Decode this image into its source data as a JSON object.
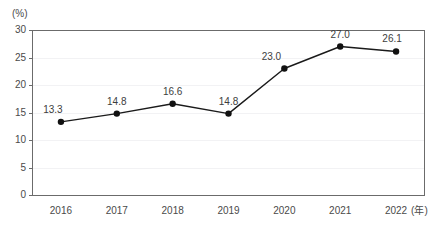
{
  "chart_data": {
    "type": "line",
    "title": "",
    "subtitle": "",
    "xlabel": "(年)",
    "ylabel": "(%)",
    "unit_label": "(%)",
    "x_unit_label": "(年)",
    "categories": [
      "2016",
      "2017",
      "2018",
      "2019",
      "2020",
      "2021",
      "2022"
    ],
    "values": [
      13.3,
      14.8,
      16.6,
      14.8,
      23.0,
      27.0,
      26.1
    ],
    "point_labels": [
      "13.3",
      "14.8",
      "16.6",
      "14.8",
      "23.0",
      "27.0",
      "26.1"
    ],
    "series": [
      {
        "name": "",
        "values": [
          13.3,
          14.8,
          16.6,
          14.8,
          23.0,
          27.0,
          26.1
        ]
      }
    ],
    "ylim": [
      0,
      30
    ],
    "y_ticks": [
      0,
      5,
      10,
      15,
      20,
      25,
      30
    ],
    "y_tick_labels": [
      "0",
      "5",
      "10",
      "15",
      "20",
      "25",
      "30"
    ],
    "grid": true,
    "grid_axis": "y",
    "legend": false,
    "legend_position": "none",
    "marker": "circle",
    "line_color": "#1a1a1a",
    "marker_color": "#111111",
    "grid_color": "#f2f2f4",
    "axis_color": "#6b6b6b",
    "text_color": "#4a4a4a",
    "background": "#ffffff"
  }
}
